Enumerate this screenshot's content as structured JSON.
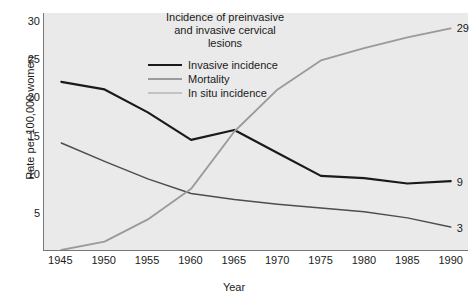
{
  "chart_data": {
    "type": "line",
    "title_lines": [
      "Incidence of preinvasive",
      "and invasive cervical",
      "lesions"
    ],
    "xlabel": "Year",
    "ylabel": "Rate per 100,000 women",
    "xlim": [
      1943,
      1992
    ],
    "ylim": [
      0,
      31
    ],
    "xticks": [
      1945,
      1950,
      1955,
      1960,
      1965,
      1970,
      1975,
      1980,
      1985,
      1990
    ],
    "xtick_labels": [
      "1945",
      "1950",
      "1955",
      "1960",
      "1965",
      "1970",
      "1975",
      "1980",
      "1985",
      "1990"
    ],
    "yticks": [
      5,
      10,
      15,
      20,
      25,
      30
    ],
    "ytick_labels": [
      "5",
      "10",
      "15",
      "20",
      "25",
      "30"
    ],
    "grid": false,
    "legend_position": "upper-center",
    "x": [
      1945,
      1950,
      1955,
      1960,
      1965,
      1970,
      1975,
      1980,
      1985,
      1990
    ],
    "series": [
      {
        "name": "Invasive incidence",
        "color": "#1a1a1a",
        "width": 2.2,
        "values": [
          22.0,
          21.0,
          18.0,
          14.4,
          15.7,
          12.7,
          9.7,
          9.4,
          8.7,
          9.0
        ],
        "end_label": "9"
      },
      {
        "name": "Mortality",
        "color": "#4d4d4d",
        "width": 1.5,
        "values": [
          14.0,
          11.6,
          9.3,
          7.4,
          6.6,
          6.0,
          5.5,
          5.0,
          4.2,
          3.0
        ],
        "end_label": "3"
      },
      {
        "name": "In situ incidence",
        "color": "#9a9a9a",
        "width": 1.8,
        "values": [
          0.0,
          1.1,
          4.0,
          8.0,
          15.5,
          21.0,
          24.8,
          26.4,
          27.8,
          29.0
        ],
        "end_label": "29"
      }
    ],
    "end_labels": [
      {
        "text": "29",
        "series": "In situ incidence",
        "value": 29
      },
      {
        "text": "9",
        "series": "Invasive incidence",
        "value": 9
      },
      {
        "text": "3",
        "series": "Mortality",
        "value": 3
      }
    ],
    "colors": {
      "plot_background": "#eaeaea",
      "page_background": "#ffffff",
      "axis": "#777777",
      "text": "#1a1a1a"
    }
  }
}
